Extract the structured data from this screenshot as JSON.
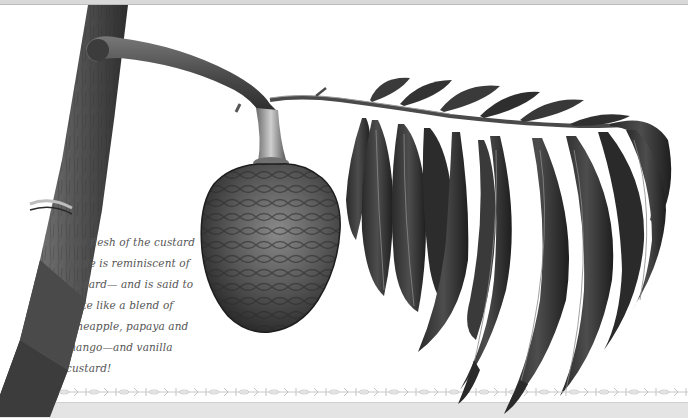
{
  "page": {
    "illustration": {
      "subject": "custard apple branch with fruit and leaves",
      "style": "graphite botanical drawing"
    },
    "caption": {
      "lines": [
        "The flesh of the custard",
        "apple is reminiscent of",
        "custard— and is said to",
        "taste like a blend of",
        "pineapple, papaya and",
        "mango—and vanilla",
        "custard!"
      ]
    },
    "decor": {
      "border_motif": "repeating bone/scroll ornament",
      "colors": {
        "background": "#ffffff",
        "border_ornament": "#c8c8c8",
        "bottom_band": "#e4e4e4",
        "graphite_dark": "#2b2b2b",
        "graphite_mid": "#5a5a5a",
        "graphite_light": "#9a9a9a",
        "caption_text": "#555555"
      }
    }
  }
}
